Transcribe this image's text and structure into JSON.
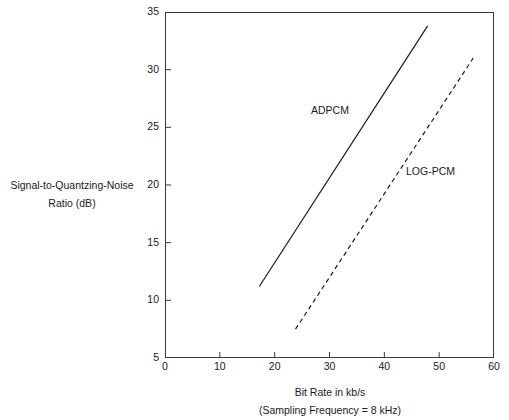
{
  "chart_data": {
    "type": "line",
    "title": "",
    "xlabel": "Bit Rate in kb/s",
    "xlabel_sub": "(Sampling Frequency = 8 kHz)",
    "ylabel_line1": "Signal-to-Quantzing-Noise",
    "ylabel_line2": "Ratio (dB)",
    "xlim": [
      0,
      60
    ],
    "ylim": [
      5,
      35
    ],
    "xticks": [
      0,
      10,
      20,
      30,
      40,
      50,
      60
    ],
    "xtick_labels": [
      "0",
      "10",
      "20",
      "30",
      "40",
      "50",
      "60"
    ],
    "yticks": [
      5,
      10,
      15,
      20,
      25,
      30,
      35
    ],
    "ytick_labels": [
      "5",
      "10",
      "15",
      "20",
      "25",
      "30",
      "35"
    ],
    "grid": false,
    "legend_position": "inline-annotation",
    "line_color": "#1a1a1a",
    "series": [
      {
        "name": "ADPCM",
        "style": "solid",
        "x": [
          17.2,
          47.9
        ],
        "y": [
          11.2,
          33.8
        ],
        "annotation": "ADPCM"
      },
      {
        "name": "LOG-PCM",
        "style": "dashed",
        "x": [
          23.8,
          56.2
        ],
        "y": [
          7.5,
          31.0
        ],
        "annotation": "LOG-PCM"
      }
    ]
  },
  "axis": {
    "x_tick_labels": [
      "0",
      "10",
      "20",
      "30",
      "40",
      "50",
      "60"
    ],
    "y_tick_labels": [
      "5",
      "10",
      "15",
      "20",
      "25",
      "30",
      "35"
    ]
  },
  "labels": {
    "y_axis_line_1": "Signal-to-Quantzing-Noise",
    "y_axis_line_2": "Ratio (dB)",
    "x_axis_line_1": "Bit Rate in kb/s",
    "x_axis_line_2": "(Sampling Frequency = 8 kHz)",
    "series_adpcm": "ADPCM",
    "series_logpcm": "LOG-PCM"
  }
}
